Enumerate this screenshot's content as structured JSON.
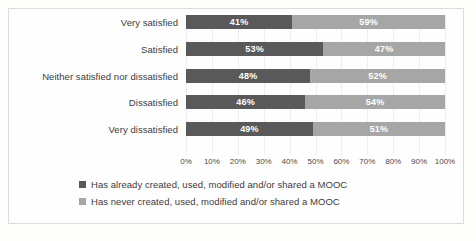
{
  "chart_data": {
    "type": "bar",
    "orientation": "horizontal",
    "stacked": true,
    "normalized_percent": true,
    "title": "",
    "subtitle": "",
    "xlabel": "",
    "ylabel": "",
    "xlim": [
      0,
      100
    ],
    "grid": true,
    "legend_position": "bottom",
    "categories": [
      "Very satisfied",
      "Satisfied",
      "Neither satisfied nor dissatisfied",
      "Dissatisfied",
      "Very dissatisfied"
    ],
    "tick_labels": [
      "0%",
      "10%",
      "20%",
      "30%",
      "40%",
      "50%",
      "60%",
      "70%",
      "80%",
      "90%",
      "100%"
    ],
    "tick_values": [
      0,
      10,
      20,
      30,
      40,
      50,
      60,
      70,
      80,
      90,
      100
    ],
    "series": [
      {
        "name": "Has already created, used, modified and/or shared a MOOC",
        "color": "#595959",
        "values": [
          41,
          53,
          48,
          46,
          49
        ],
        "labels": [
          "41%",
          "53%",
          "48%",
          "46%",
          "49%"
        ]
      },
      {
        "name": "Has never created, used, modified and/or shared a MOOC",
        "color": "#a6a6a6",
        "values": [
          59,
          47,
          52,
          54,
          51
        ],
        "labels": [
          "59%",
          "47%",
          "52%",
          "54%",
          "51%"
        ]
      }
    ]
  }
}
